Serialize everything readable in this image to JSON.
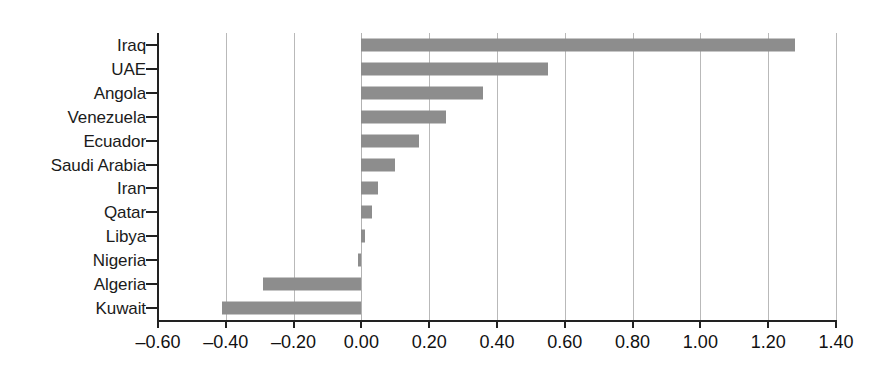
{
  "chart_data": {
    "type": "bar",
    "orientation": "horizontal",
    "title": "",
    "subtitle": "",
    "xlabel": "",
    "ylabel": "",
    "categories": [
      "Iraq",
      "UAE",
      "Angola",
      "Venezuela",
      "Ecuador",
      "Saudi Arabia",
      "Iran",
      "Qatar",
      "Libya",
      "Nigeria",
      "Algeria",
      "Kuwait"
    ],
    "values": [
      1.28,
      0.55,
      0.36,
      0.25,
      0.17,
      0.1,
      0.05,
      0.03,
      0.01,
      -0.01,
      -0.29,
      -0.41
    ],
    "xlim": [
      -0.6,
      1.4
    ],
    "xticks": [
      -0.6,
      -0.4,
      -0.2,
      0.0,
      0.2,
      0.4,
      0.6,
      0.8,
      1.0,
      1.2,
      1.4
    ],
    "xtick_labels": [
      "–0.60",
      "–0.40",
      "–0.20",
      "0.00",
      "0.20",
      "0.40",
      "0.60",
      "0.80",
      "1.00",
      "1.20",
      "1.40"
    ],
    "grid": true,
    "grid_axis": "x",
    "legend": false,
    "legend_position": "none",
    "bar_color": "#8d8d8d",
    "gridline_color": "#b9b9b9",
    "axis_color": "#222222",
    "background_color": "#ffffff"
  }
}
